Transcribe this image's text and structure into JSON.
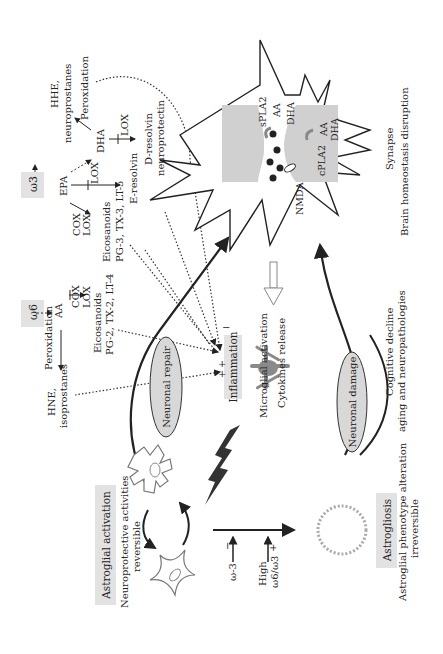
{
  "figure": {
    "orientation": "rotated -90deg (text reads bottom-to-top)",
    "colors": {
      "background": "#ffffff",
      "label_box": "#e2e2e2",
      "cell_fill": "#d0d0d0",
      "ellipse_fill": "#d8d8d8",
      "microglia": "#8a8a8a",
      "line": "#222222",
      "dotted": "#333333"
    }
  },
  "omega3": {
    "box_label": "ω3",
    "epa": "EPA",
    "cox_lox_1": "COX",
    "cox_lox_2": "LOX",
    "lox_to_dha": "LOX",
    "eicosanoids": "Eicosanoids",
    "eicosanoids_list": "PG-3, TX-3, LT-5",
    "e_resolvin": "E-resolvin",
    "dha": "DHA",
    "lox_dha": "LOX",
    "d_resolvin": "D-resolvin",
    "neuroprotectin": "neuroprotectin",
    "hhe": "HHE,",
    "neuroprostanes": "neuroprostanes",
    "peroxidation": "Peroxidation"
  },
  "omega6": {
    "box_label": "ω6",
    "aa": "AA",
    "peroxidation": "Peroxidation",
    "cox": "COX",
    "lox": "LOX",
    "eicosanoids": "Eicosanoids",
    "eicosanoids_list": "PG-2, TX-2, LT-4",
    "hne": "HNE,",
    "isoprostanes": "isoprostanes"
  },
  "synapse": {
    "spla2": "sPLA2",
    "aa_top": "AA",
    "dha_top": "DHA",
    "cpla2": "cPLA2",
    "aa_right": "AA",
    "dha_right": "DHA",
    "nmda": "NMDA",
    "title": "Synapse",
    "subtitle": "Brain homeostasis disruption"
  },
  "center": {
    "neuronal_repair": "Neuronal repair",
    "inflammation": "Inflammation",
    "minus_sign": "−",
    "plus_sign_1": "+",
    "plus_sign_2": "+",
    "microglial_activation": "Microglial activation",
    "cytokines_release": "Cytokines release",
    "neuronal_damage": "Neuronal damage",
    "cognitive_decline": "Cognitive decline",
    "aging": "aging and neuropathologies"
  },
  "astroglia": {
    "activation_box": "Astroglial activation",
    "activation_desc_1": "Neuroprotective activities",
    "activation_desc_2": "reversible",
    "gliosis_box": "Astrogliosis",
    "gliosis_desc_1": "Astroglial phenotype alteration",
    "gliosis_desc_2": "irreversible"
  },
  "axis": {
    "omega3_label": "ω-3",
    "omega3_sign": "−",
    "high_label": "High",
    "ratio_label": "ω6/ω3",
    "ratio_sign": "+"
  }
}
